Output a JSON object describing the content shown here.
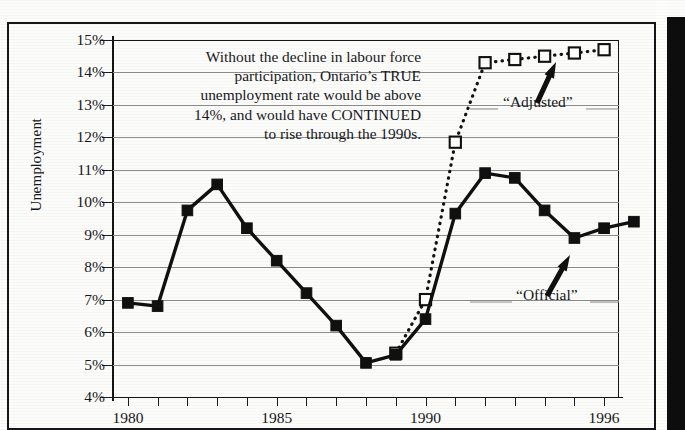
{
  "chart_data": {
    "type": "line",
    "title": "",
    "xlabel": "",
    "ylabel": "Unemployment",
    "ylim": [
      4,
      15
    ],
    "xlim": [
      1979.5,
      1996.5
    ],
    "ytick_labels": [
      "15%",
      "14%",
      "13%",
      "12%",
      "11%",
      "10%",
      "9%",
      "8%",
      "7%",
      "6%",
      "5%",
      "4%"
    ],
    "ytick_values": [
      15,
      14,
      13,
      12,
      11,
      10,
      9,
      8,
      7,
      6,
      5,
      4
    ],
    "xtick_values": [
      1980,
      1981,
      1982,
      1983,
      1984,
      1985,
      1986,
      1987,
      1988,
      1989,
      1990,
      1991,
      1992,
      1993,
      1994,
      1995,
      1996
    ],
    "xtick_labels_shown": [
      "1980",
      "1985",
      "1990",
      "1996"
    ],
    "grid": true,
    "legend_position": "inline-annotation",
    "series": [
      {
        "name": "“Official”",
        "style": "solid",
        "marker": "filled-square",
        "x": [
          1980,
          1981,
          1982,
          1983,
          1984,
          1985,
          1986,
          1987,
          1988,
          1989,
          1990,
          1991,
          1992,
          1993,
          1994,
          1995,
          1996
        ],
        "values": [
          6.9,
          6.8,
          9.75,
          10.55,
          9.2,
          8.2,
          7.2,
          6.2,
          5.05,
          5.3,
          6.4,
          9.65,
          10.9,
          10.75,
          9.75,
          8.9,
          9.2
        ]
      },
      {
        "name": "“Adjusted”",
        "style": "dotted",
        "marker": "open-square",
        "x": [
          1989,
          1990,
          1991,
          1992,
          1993,
          1994,
          1995,
          1996
        ],
        "values": [
          5.35,
          7.0,
          11.85,
          14.3,
          14.4,
          14.5,
          14.6,
          14.7
        ]
      }
    ],
    "extra_point_note": "solid series extends to 1997 at 9.4",
    "annotations": [
      {
        "name": "main-callout",
        "text": "Without the decline in labour force participation, Ontario’s TRUE unemployment rate would be above 14%, and would have CONTINUED to rise through the 1990s."
      },
      {
        "name": "adjusted-arrow",
        "text": "“Adjusted”",
        "points_to": "adjusted series near 1995"
      },
      {
        "name": "official-arrow",
        "text": "“Official”",
        "points_to": "official series near 1995"
      }
    ]
  },
  "axis": {
    "y_title_letters": [
      "U",
      "n",
      "e",
      "m",
      "p",
      "l",
      "o",
      "y",
      "m",
      "e",
      "n",
      "t"
    ],
    "y_title": "Unemployment"
  },
  "annotation": {
    "line1": "Without the decline in labour force",
    "line2": "participation, Ontario’s TRUE",
    "line3": "unemployment rate would be above",
    "line4": "14%, and would have CONTINUED",
    "line5": "to rise through the 1990s."
  },
  "labels": {
    "adjusted": "“Adjusted”",
    "official": "“Official”"
  },
  "colors": {
    "ink": "#17171c",
    "grid": "#8e8e8e",
    "paper": "#fcfcfa",
    "edge": "#0d0d0d"
  }
}
